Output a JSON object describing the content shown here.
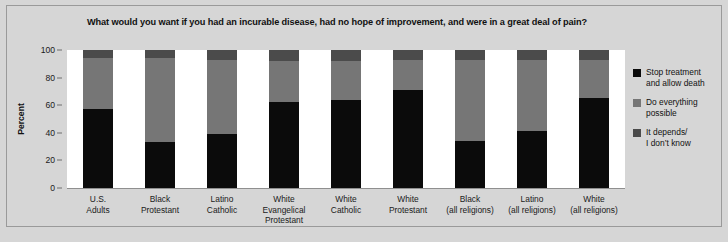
{
  "chart_data": {
    "type": "bar",
    "subtype": "stacked-column-100",
    "title": "What would you want if you had an incurable disease, had no hope of improvement, and were in a great deal of pain?",
    "xlabel": "",
    "ylabel": "Percent",
    "ylim": [
      0,
      100
    ],
    "yticks": [
      0,
      20,
      40,
      60,
      80,
      100
    ],
    "grid": false,
    "legend_position": "right",
    "categories": [
      [
        "U.S.",
        "Adults"
      ],
      [
        "Black",
        "Protestant"
      ],
      [
        "Latino",
        "Catholic"
      ],
      [
        "White",
        "Evangelical",
        "Protestant"
      ],
      [
        "White",
        "Catholic"
      ],
      [
        "White",
        "Protestant"
      ],
      [
        "Black",
        "(all religions)"
      ],
      [
        "Latino",
        "(all religions)"
      ],
      [
        "White",
        "(all religions)"
      ]
    ],
    "category_labels": [
      "U.S. Adults",
      "Black Protestant",
      "Latino Catholic",
      "White Evangelical Protestant",
      "White Catholic",
      "White Protestant",
      "Black (all religions)",
      "Latino (all religions)",
      "White (all religions)"
    ],
    "series": [
      {
        "name": "Stop treatment and allow death",
        "name_lines": [
          "Stop treatment",
          "and allow death"
        ],
        "color": "#0b0b0b",
        "values": [
          57,
          33,
          39,
          62,
          64,
          71,
          34,
          41,
          65
        ]
      },
      {
        "name": "Do everything possible",
        "name_lines": [
          "Do everything",
          "possible"
        ],
        "color": "#767676",
        "values": [
          37,
          61,
          54,
          30,
          28,
          22,
          59,
          52,
          28
        ]
      },
      {
        "name": "It depends/ I don't know",
        "name_lines": [
          "It depends/",
          "I don’t know"
        ],
        "color": "#4b4b4b",
        "values": [
          6,
          6,
          7,
          8,
          8,
          7,
          7,
          7,
          7
        ]
      }
    ]
  }
}
